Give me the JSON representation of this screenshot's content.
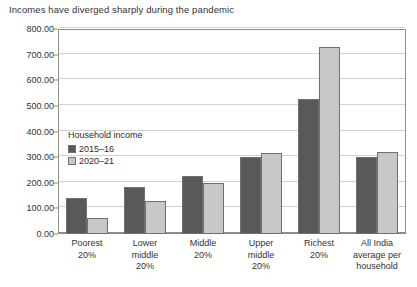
{
  "chart_data": {
    "type": "bar",
    "title": "Incomes have diverged sharply during the pandemic",
    "xlabel": "",
    "ylabel": "",
    "ylim": [
      0,
      800
    ],
    "ytick_step": 100,
    "ytick_labels": [
      "800.00",
      "700.00",
      "600.00",
      "500.00",
      "400.00",
      "300.00",
      "200.00",
      "100.00",
      "0.00"
    ],
    "ytick_values": [
      800,
      700,
      600,
      500,
      400,
      300,
      200,
      100,
      0
    ],
    "grid": "horizontal",
    "legend_position": "inside-upper-left",
    "legend_title": "Household income",
    "categories": [
      "Poorest\n20%",
      "Lower\nmiddle\n20%",
      "Middle\n20%",
      "Upper\nmiddle\n20%",
      "Richest\n20%",
      "All India\naverage per\nhousehold"
    ],
    "series": [
      {
        "name": "2015–16",
        "color": "#595959",
        "values": [
          140,
          185,
          225,
          300,
          525,
          300
        ]
      },
      {
        "name": "2020–21",
        "color": "#c8c8c8",
        "values": [
          62,
          128,
          200,
          318,
          730,
          320
        ]
      }
    ]
  },
  "colors": {
    "series_2015_16": "#595959",
    "series_2020_21": "#c8c8c8",
    "gridline": "#d2d2d2",
    "axis": "#8d8d8d",
    "text": "#333333",
    "background": "#ffffff"
  }
}
